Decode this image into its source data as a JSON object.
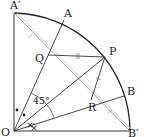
{
  "labels": {
    "A_prime": "A′",
    "A": "A",
    "P": "P",
    "Q": "Q",
    "B": "B",
    "R": "R",
    "O": "O",
    "B_prime": "B′",
    "angle": "45°"
  },
  "colors": {
    "line": "#333333",
    "gray_line": "#9a9a9a",
    "background": "#ffffff"
  }
}
